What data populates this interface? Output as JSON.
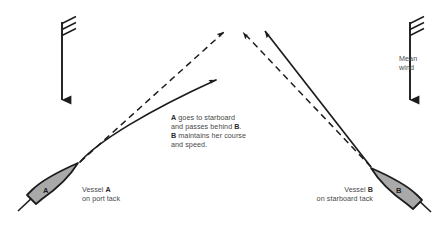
{
  "diagram": {
    "background_color": "#ffffff",
    "line_color": "#1c1c1c",
    "hull_fill_color": "#a9a9a9",
    "hull_stroke_color": "#1c1c1c",
    "text_color": "#4a4a4a",
    "bold_text_color": "#2b2b2b"
  },
  "note": {
    "lines": [
      {
        "id": "line1",
        "prefix_bold": "A",
        "rest": " goes to starboard"
      },
      {
        "id": "line2",
        "prefix_bold": "",
        "rest": "and passes behind ",
        "suffix_bold": "B",
        "tail": "."
      },
      {
        "id": "line3",
        "prefix_bold": "B",
        "rest": " maintains her course"
      },
      {
        "id": "line4",
        "prefix_bold": "",
        "rest": "and speed."
      }
    ],
    "line1_bold": "A",
    "line1_text": " goes to starboard",
    "line2_text": "and passes behind ",
    "line2_bold": "B",
    "line2_tail": ".",
    "line3_bold": "B",
    "line3_text": " maintains her course",
    "line4_text": "and speed."
  },
  "vessel_a": {
    "hull_label": "A",
    "caption_line1_prefix": "Vessel ",
    "caption_line1_bold": "A",
    "caption_line2": "on port tack"
  },
  "vessel_b": {
    "hull_label": "B",
    "caption_line1_prefix": "Vessel ",
    "caption_line1_bold": "B",
    "caption_line2": "on starboard tack"
  },
  "wind": {
    "label_line1": "Mean",
    "label_line2": "wind",
    "direction": "downward",
    "barb_count": 3,
    "arrow_left_name": "wind-arrow-left",
    "arrow_right_name": "wind-arrow-right"
  },
  "tracks": {
    "vessel_a_original_track": "dashed line from vessel A bow up-right to convergence point",
    "vessel_a_altered_course": "solid curved arrow bending to starboard",
    "vessel_b_original_track": "dashed line from vessel B bow up-left to convergence point",
    "vessel_b_maintained_course": "solid line from vessel B up-left"
  }
}
